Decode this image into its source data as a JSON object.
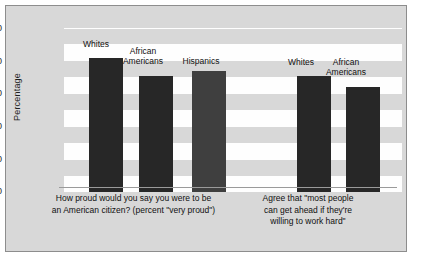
{
  "chart_data": {
    "type": "bar",
    "title": "",
    "subtitle": "",
    "xlabel": "",
    "ylabel": "Percentage",
    "ylim": [
      0,
      100
    ],
    "yticks": [
      100,
      80,
      60,
      40,
      20,
      0
    ],
    "grid": "horizontal-bands",
    "legend": "none",
    "groups": [
      {
        "caption": "How proud would you say you were to be an American citizen? (percent \"very proud\")",
        "caption_lines": [
          "How proud would you say you were to be",
          "an American citizen? (percent \"very proud\")"
        ],
        "categories": [
          "Whites",
          "African Americans",
          "Hispanics"
        ],
        "category_lines": [
          [
            "Whites"
          ],
          [
            "African",
            "Americans"
          ],
          [
            "Hispanics"
          ]
        ],
        "values": [
          82,
          71,
          74
        ],
        "colors": [
          "#272727",
          "#272727",
          "#3f3f3f"
        ]
      },
      {
        "caption": "Agree that \"most people can get ahead if they're willing to work hard\"",
        "caption_lines": [
          "Agree that \"most people",
          "can get ahead if they're",
          "willing to work hard\""
        ],
        "categories": [
          "Whites",
          "African Americans"
        ],
        "category_lines": [
          [
            "Whites"
          ],
          [
            "African",
            "Americans"
          ]
        ],
        "values": [
          71,
          64
        ],
        "colors": [
          "#272727",
          "#272727"
        ]
      }
    ]
  },
  "axis": {
    "ylabel": "Percentage",
    "tick_100": "100",
    "tick_80": "80",
    "tick_60": "60",
    "tick_40": "40",
    "tick_20": "20",
    "tick_0": "0"
  },
  "labels": {
    "g1_b1_l1": "Whites",
    "g1_b2_l1": "African",
    "g1_b2_l2": "Americans",
    "g1_b3_l1": "Hispanics",
    "g2_b1_l1": "Whites",
    "g2_b2_l1": "African",
    "g2_b2_l2": "Americans"
  },
  "captions": {
    "g1_line1": "How proud would you say you were to be",
    "g1_line2": "an American citizen? (percent \"very proud\")",
    "g2_line1": "Agree that \"most people",
    "g2_line2": "can get ahead if they're",
    "g2_line3": "willing to work hard\""
  }
}
